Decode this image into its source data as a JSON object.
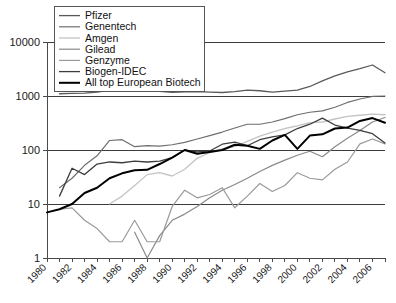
{
  "chart_data": {
    "type": "line",
    "title": "",
    "subtitle": "",
    "xlabel": "",
    "ylabel": "",
    "yscale": "log",
    "ylim": [
      1,
      10000
    ],
    "xlim": [
      1980,
      2007
    ],
    "grid": true,
    "legend_position": "top-left",
    "y_ticks": [
      "1",
      "10",
      "100",
      "1000",
      "10000"
    ],
    "y_tick_values": [
      1,
      10,
      100,
      1000,
      10000
    ],
    "x_ticks": [
      "1980",
      "1982",
      "1984",
      "1986",
      "1988",
      "1990",
      "1992",
      "1994",
      "1996",
      "1998",
      "2000",
      "2002",
      "2004",
      "2006"
    ],
    "x_tick_values": [
      1980,
      1982,
      1984,
      1986,
      1988,
      1990,
      1992,
      1994,
      1996,
      1998,
      2000,
      2002,
      2004,
      2006
    ],
    "x": [
      1980,
      1981,
      1982,
      1983,
      1984,
      1985,
      1986,
      1987,
      1988,
      1989,
      1990,
      1991,
      1992,
      1993,
      1994,
      1995,
      1996,
      1997,
      1998,
      1999,
      2000,
      2001,
      2002,
      2003,
      2004,
      2005,
      2006,
      2007
    ],
    "series": [
      {
        "name": "Pfizer",
        "color": "#5a5a5a",
        "width": 1.3,
        "values": [
          null,
          1100,
          1120,
          1130,
          1180,
          1270,
          1330,
          1340,
          1290,
          1220,
          1170,
          1190,
          1200,
          1180,
          1160,
          1200,
          1280,
          1250,
          1180,
          1230,
          1280,
          1500,
          1900,
          2350,
          2800,
          3200,
          3750,
          2700
        ]
      },
      {
        "name": "Genentech",
        "color": "#6e6e6e",
        "width": 1.2,
        "values": [
          null,
          20,
          30,
          52,
          78,
          150,
          155,
          115,
          120,
          118,
          125,
          138,
          160,
          185,
          215,
          255,
          300,
          300,
          330,
          380,
          450,
          500,
          530,
          620,
          760,
          880,
          980,
          1000
        ]
      },
      {
        "name": "Amgen",
        "color": "#c4c4c4",
        "width": 1.3,
        "values": [
          null,
          null,
          null,
          null,
          null,
          10,
          14,
          22,
          35,
          38,
          33,
          44,
          70,
          90,
          105,
          115,
          145,
          180,
          215,
          250,
          280,
          320,
          330,
          375,
          420,
          440,
          460,
          450
        ]
      },
      {
        "name": "Gilead",
        "color": "#8a8a8a",
        "width": 1.2,
        "values": [
          null,
          null,
          null,
          null,
          null,
          null,
          null,
          3,
          1,
          2.6,
          5,
          6.5,
          9,
          13,
          18,
          23,
          30,
          40,
          52,
          65,
          80,
          95,
          75,
          115,
          165,
          230,
          330,
          400
        ]
      },
      {
        "name": "Genzyme",
        "color": "#9a9a9a",
        "width": 1.2,
        "values": [
          null,
          8,
          8.5,
          5,
          3.5,
          2,
          2,
          5,
          2,
          2,
          9,
          18,
          13,
          15,
          20,
          8.5,
          14,
          24,
          17,
          22,
          38,
          30,
          28,
          44,
          60,
          130,
          160,
          130
        ]
      },
      {
        "name": "Biogen-IDEC",
        "color": "#3d3d3d",
        "width": 1.3,
        "values": [
          null,
          14,
          46,
          35,
          55,
          60,
          58,
          62,
          60,
          62,
          72,
          100,
          92,
          96,
          128,
          140,
          120,
          155,
          175,
          190,
          250,
          300,
          390,
          290,
          255,
          230,
          200,
          135
        ]
      },
      {
        "name": "All top European Biotech",
        "color": "#000000",
        "width": 2.0,
        "values": [
          7,
          8,
          10,
          16,
          20,
          30,
          37,
          42,
          43,
          55,
          72,
          100,
          85,
          92,
          100,
          125,
          120,
          105,
          150,
          190,
          105,
          185,
          195,
          250,
          260,
          345,
          390,
          320
        ]
      }
    ]
  },
  "legend": {
    "entries": [
      {
        "label": "Pfizer"
      },
      {
        "label": "Genentech"
      },
      {
        "label": "Amgen"
      },
      {
        "label": "Gilead"
      },
      {
        "label": "Genzyme"
      },
      {
        "label": "Biogen-IDEC"
      },
      {
        "label": "All top European Biotech"
      }
    ]
  }
}
